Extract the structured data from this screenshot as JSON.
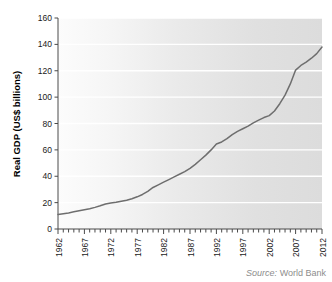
{
  "chart_data": {
    "type": "line",
    "title": "",
    "xlabel": "",
    "ylabel": "Real GDP (US$ billions)",
    "xlim": [
      1962,
      2012
    ],
    "ylim": [
      0,
      160
    ],
    "grid": true,
    "legend_position": "none",
    "y_ticks": [
      0,
      20,
      40,
      60,
      80,
      100,
      120,
      140,
      160
    ],
    "y_tick_labels": [
      "0",
      "20",
      "40",
      "60",
      "80",
      "100",
      "120",
      "140",
      "160"
    ],
    "x_ticks": [
      1962,
      1967,
      1972,
      1977,
      1982,
      1987,
      1992,
      1997,
      2002,
      2007,
      2012
    ],
    "x_tick_labels": [
      "1962",
      "1967",
      "1972",
      "1977",
      "1982",
      "1987",
      "1992",
      "1997",
      "2002",
      "2007",
      "2012"
    ],
    "x_minor_tick_interval": 1,
    "series": [
      {
        "name": "Real GDP",
        "color": "#6e6e6e",
        "x": [
          1962,
          1963,
          1964,
          1965,
          1966,
          1967,
          1968,
          1969,
          1970,
          1971,
          1972,
          1973,
          1974,
          1975,
          1976,
          1977,
          1978,
          1979,
          1980,
          1981,
          1982,
          1983,
          1984,
          1985,
          1986,
          1987,
          1988,
          1989,
          1990,
          1991,
          1992,
          1993,
          1994,
          1995,
          1996,
          1997,
          1998,
          1999,
          2000,
          2001,
          2002,
          2003,
          2004,
          2005,
          2006,
          2007,
          2008,
          2009,
          2010,
          2011,
          2012
        ],
        "values": [
          11,
          11.6,
          12.2,
          13,
          13.8,
          14.6,
          15.4,
          16.4,
          17.6,
          19,
          19.8,
          20.2,
          21,
          21.8,
          23,
          24.4,
          26.2,
          28.6,
          31.5,
          33.5,
          35.5,
          37.5,
          39.5,
          41.5,
          43.5,
          46,
          49,
          52.5,
          56,
          60,
          64.5,
          66,
          68.5,
          71.5,
          74,
          76,
          78,
          80.5,
          82.5,
          84.5,
          86,
          89.5,
          95,
          101.5,
          110,
          120.5,
          124,
          126.5,
          129.5,
          133,
          138
        ]
      }
    ],
    "annotations": {
      "source": {
        "lead": "Source:",
        "name": "World Bank"
      }
    }
  },
  "geometry": {
    "plot_left": 58,
    "plot_right": 322,
    "plot_top": 18,
    "plot_bottom": 229
  },
  "colors": {
    "line": "#6e6e6e",
    "axis": "#4a4a4a",
    "grid": "#ffffff",
    "plot_bg_left": "#fbfbfb",
    "plot_bg_right": "#dddddd",
    "tick_text": "#1a1a1a",
    "source_text": "#8d8d8d"
  }
}
